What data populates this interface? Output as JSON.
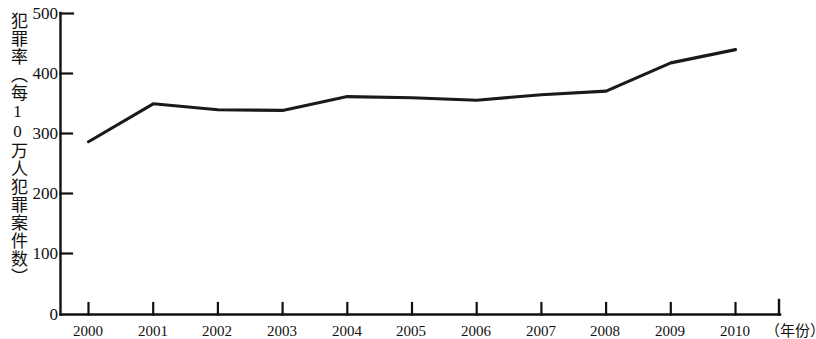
{
  "chart_data": {
    "type": "line",
    "title": "",
    "subtitle": "",
    "xlabel": "（年份）",
    "ylabel": "犯罪率（每10万人犯罪案件数）",
    "categories": [
      "2000",
      "2001",
      "2002",
      "2003",
      "2004",
      "2005",
      "2006",
      "2007",
      "2008",
      "2009",
      "2010"
    ],
    "x": [
      2000,
      2001,
      2002,
      2003,
      2004,
      2005,
      2006,
      2007,
      2008,
      2009,
      2010
    ],
    "values": [
      287,
      350,
      340,
      339,
      362,
      360,
      356,
      365,
      371,
      418,
      440
    ],
    "series": [
      {
        "name": "犯罪率",
        "values": [
          287,
          350,
          340,
          339,
          362,
          360,
          356,
          365,
          371,
          418,
          440
        ]
      }
    ],
    "ylim": [
      0,
      500
    ],
    "xlim": [
      2000,
      2010
    ],
    "y_ticks": [
      0,
      100,
      200,
      300,
      400,
      500
    ],
    "y_tick_labels": [
      "0",
      "100",
      "200",
      "300",
      "400",
      "500"
    ],
    "x_ticks": [
      2000,
      2001,
      2002,
      2003,
      2004,
      2005,
      2006,
      2007,
      2008,
      2009,
      2010
    ],
    "x_tick_labels": [
      "2000",
      "2001",
      "2002",
      "2003",
      "2004",
      "2005",
      "2006",
      "2007",
      "2008",
      "2009",
      "2010"
    ],
    "grid": false,
    "legend": false,
    "legend_position": "none",
    "line_color": "#1a1a1a",
    "axis_color": "#111111",
    "background_color": "#ffffff",
    "annotations": []
  },
  "axes": {
    "y_title": "犯罪率（每10万人犯罪案件数）",
    "x_unit_label": "（年份）",
    "y_labels": [
      "500",
      "400",
      "300",
      "200",
      "100",
      "0"
    ],
    "x_labels": [
      "2000",
      "2001",
      "2002",
      "2003",
      "2004",
      "2005",
      "2006",
      "2007",
      "2008",
      "2009",
      "2010"
    ]
  }
}
